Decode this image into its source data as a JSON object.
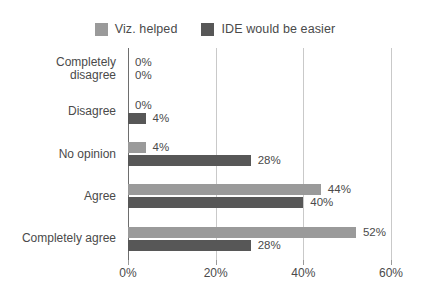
{
  "chart_data": {
    "type": "bar",
    "orientation": "horizontal",
    "title": "",
    "xlabel": "",
    "ylabel": "",
    "categories": [
      "Completely disagree",
      "Disagree",
      "No opinion",
      "Agree",
      "Completely agree"
    ],
    "category_lines": [
      [
        "Completely",
        "disagree"
      ],
      [
        "Disagree"
      ],
      [
        "No opinion"
      ],
      [
        "Agree"
      ],
      [
        "Completely agree"
      ]
    ],
    "series": [
      {
        "name": "Viz. helped",
        "color": "#9a9a9a",
        "values": [
          0,
          0,
          4,
          44,
          52
        ],
        "labels": [
          "0%",
          "0%",
          "4%",
          "44%",
          "52%"
        ]
      },
      {
        "name": "IDE would be easier",
        "color": "#575757",
        "values": [
          0,
          4,
          28,
          40,
          28
        ],
        "labels": [
          "0%",
          "4%",
          "28%",
          "40%",
          "28%"
        ]
      }
    ],
    "xlim": [
      0,
      60
    ],
    "xticks": [
      0,
      20,
      40,
      60
    ],
    "xtick_labels": [
      "0%",
      "20%",
      "40%",
      "60%"
    ],
    "grid": true,
    "legend_position": "top"
  },
  "legend": {
    "entries": [
      {
        "label": "Viz. helped",
        "swatch": "#9a9a9a"
      },
      {
        "label": "IDE would be easier",
        "swatch": "#575757"
      }
    ]
  },
  "colors": {
    "series_light": "#9a9a9a",
    "series_dark": "#575757",
    "gridline": "#c9c9c9",
    "axis": "#6e6e6e",
    "text": "#4a4a4a",
    "background": "#ffffff"
  }
}
